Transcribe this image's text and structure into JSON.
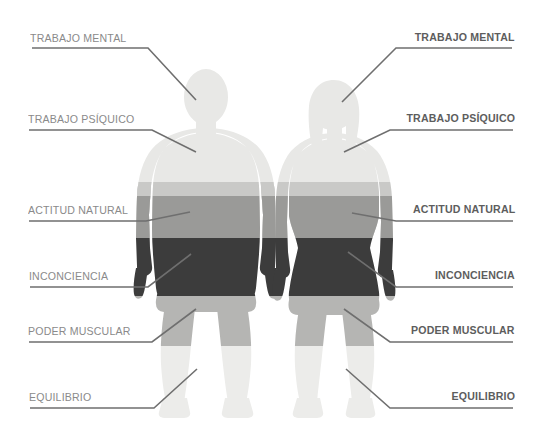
{
  "diagram": {
    "title_text": "",
    "figures": [
      {
        "name": "male-figure",
        "bands": [
          {
            "zone": "TRABAJO MENTAL",
            "color": "#e8e8e6"
          },
          {
            "zone": "TRABAJO PSÍQUICO",
            "color": "#c9c9c7"
          },
          {
            "zone": "ACTITUD NATURAL",
            "color": "#9a9a98"
          },
          {
            "zone": "INCONCIENCIA",
            "color": "#3c3c3c"
          },
          {
            "zone": "PODER MUSCULAR",
            "color": "#b5b5b3"
          },
          {
            "zone": "EQUILIBRIO",
            "color": "#ececea"
          }
        ]
      },
      {
        "name": "female-figure",
        "bands": [
          {
            "zone": "TRABAJO MENTAL",
            "color": "#e8e8e6"
          },
          {
            "zone": "TRABAJO PSÍQUICO",
            "color": "#c9c9c7"
          },
          {
            "zone": "ACTITUD NATURAL",
            "color": "#9a9a98"
          },
          {
            "zone": "INCONCIENCIA",
            "color": "#3c3c3c"
          },
          {
            "zone": "PODER MUSCULAR",
            "color": "#b5b5b3"
          },
          {
            "zone": "EQUILIBRIO",
            "color": "#ececea"
          }
        ]
      }
    ],
    "left_labels": [
      {
        "text": "TRABAJO MENTAL"
      },
      {
        "text": "TRABAJO PSÍQUICO"
      },
      {
        "text": "ACTITUD NATURAL"
      },
      {
        "text": "INCONCIENCIA"
      },
      {
        "text": "PODER MUSCULAR"
      },
      {
        "text": "EQUILIBRIO"
      }
    ],
    "right_labels": [
      {
        "text": "TRABAJO MENTAL"
      },
      {
        "text": "TRABAJO PSÍQUICO"
      },
      {
        "text": "ACTITUD NATURAL"
      },
      {
        "text": "INCONCIENCIA"
      },
      {
        "text": "PODER MUSCULAR"
      },
      {
        "text": "EQUILIBRIO"
      }
    ],
    "colors": {
      "label_left": "#8a8a8a",
      "label_right": "#5d5d5d",
      "leader_line": "#6f6f6f",
      "background": "#ffffff"
    }
  }
}
